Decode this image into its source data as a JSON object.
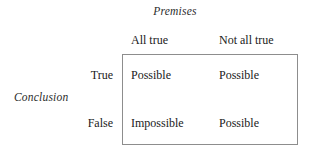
{
  "diagram": {
    "column_axis_label": "Premises",
    "row_axis_label": "Conclusion",
    "column_headers": [
      "All true",
      "Not all true"
    ],
    "row_headers": [
      "True",
      "False"
    ],
    "cells": [
      [
        "Possible",
        "Possible"
      ],
      [
        "Impossible",
        "Possible"
      ]
    ],
    "colors": {
      "border": "#8d8d8d",
      "text": "#1a1a1a",
      "background": "#ffffff"
    }
  }
}
